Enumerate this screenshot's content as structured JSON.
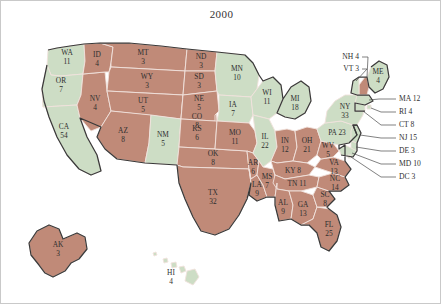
{
  "title": "2000",
  "colors": {
    "republican": "#c08a78",
    "democrat": "#cdddc5",
    "state_border": "#f0e2dc",
    "country_outline": "#3a3a3a",
    "background": "#ffffff",
    "frame": "#c9c9c9",
    "text": "#2f2f2f"
  },
  "chart_data": {
    "type": "map",
    "title": "2000",
    "subtitle": "",
    "xlabel": "",
    "ylabel": "",
    "legend": [],
    "value_field": "electoral_votes",
    "category_field": "party_color",
    "categories": [
      "republican",
      "democrat"
    ],
    "annotations": [],
    "states": [
      {
        "code": "WA",
        "votes": 11,
        "party": "democrat",
        "label": "WA",
        "value_label": "11"
      },
      {
        "code": "OR",
        "votes": 7,
        "party": "democrat",
        "label": "OR",
        "value_label": "7"
      },
      {
        "code": "CA",
        "votes": 54,
        "party": "democrat",
        "label": "CA",
        "value_label": "54"
      },
      {
        "code": "NV",
        "votes": 4,
        "party": "republican",
        "label": "NV",
        "value_label": "4"
      },
      {
        "code": "ID",
        "votes": 4,
        "party": "republican",
        "label": "ID",
        "value_label": "4"
      },
      {
        "code": "MT",
        "votes": 3,
        "party": "republican",
        "label": "MT",
        "value_label": "3"
      },
      {
        "code": "WY",
        "votes": 3,
        "party": "republican",
        "label": "WY",
        "value_label": "3"
      },
      {
        "code": "UT",
        "votes": 5,
        "party": "republican",
        "label": "UT",
        "value_label": "5"
      },
      {
        "code": "AZ",
        "votes": 8,
        "party": "republican",
        "label": "AZ",
        "value_label": "8"
      },
      {
        "code": "NM",
        "votes": 5,
        "party": "democrat",
        "label": "NM",
        "value_label": "5"
      },
      {
        "code": "CO",
        "votes": 8,
        "party": "republican",
        "label": "CO",
        "value_label": "8"
      },
      {
        "code": "ND",
        "votes": 3,
        "party": "republican",
        "label": "ND",
        "value_label": "3"
      },
      {
        "code": "SD",
        "votes": 3,
        "party": "republican",
        "label": "SD",
        "value_label": "3"
      },
      {
        "code": "NE",
        "votes": 5,
        "party": "republican",
        "label": "NE",
        "value_label": "5"
      },
      {
        "code": "KS",
        "votes": 6,
        "party": "republican",
        "label": "KS",
        "value_label": "6"
      },
      {
        "code": "OK",
        "votes": 8,
        "party": "republican",
        "label": "OK",
        "value_label": "8"
      },
      {
        "code": "TX",
        "votes": 32,
        "party": "republican",
        "label": "TX",
        "value_label": "32"
      },
      {
        "code": "MN",
        "votes": 10,
        "party": "democrat",
        "label": "MN",
        "value_label": "10"
      },
      {
        "code": "IA",
        "votes": 7,
        "party": "democrat",
        "label": "IA",
        "value_label": "7"
      },
      {
        "code": "MO",
        "votes": 11,
        "party": "republican",
        "label": "MO",
        "value_label": "11"
      },
      {
        "code": "AR",
        "votes": 6,
        "party": "republican",
        "label": "AR",
        "value_label": "6"
      },
      {
        "code": "LA",
        "votes": 9,
        "party": "republican",
        "label": "LA",
        "value_label": "9"
      },
      {
        "code": "WI",
        "votes": 11,
        "party": "democrat",
        "label": "WI",
        "value_label": "11"
      },
      {
        "code": "IL",
        "votes": 22,
        "party": "democrat",
        "label": "IL",
        "value_label": "22"
      },
      {
        "code": "MS",
        "votes": 7,
        "party": "republican",
        "label": "MS",
        "value_label": "7"
      },
      {
        "code": "MI",
        "votes": 18,
        "party": "democrat",
        "label": "MI",
        "value_label": "18"
      },
      {
        "code": "IN",
        "votes": 12,
        "party": "republican",
        "label": "IN",
        "value_label": "12"
      },
      {
        "code": "OH",
        "votes": 21,
        "party": "republican",
        "label": "OH",
        "value_label": "21"
      },
      {
        "code": "KY",
        "votes": 8,
        "party": "republican",
        "label": "KY 8",
        "value_label": ""
      },
      {
        "code": "TN",
        "votes": 11,
        "party": "republican",
        "label": "TN 11",
        "value_label": ""
      },
      {
        "code": "AL",
        "votes": 9,
        "party": "republican",
        "label": "AL",
        "value_label": "9"
      },
      {
        "code": "GA",
        "votes": 13,
        "party": "republican",
        "label": "GA",
        "value_label": "13"
      },
      {
        "code": "FL",
        "votes": 25,
        "party": "republican",
        "label": "FL",
        "value_label": "25"
      },
      {
        "code": "SC",
        "votes": 8,
        "party": "republican",
        "label": "SC",
        "value_label": "8"
      },
      {
        "code": "NC",
        "votes": 14,
        "party": "republican",
        "label": "NC",
        "value_label": "14"
      },
      {
        "code": "VA",
        "votes": 13,
        "party": "republican",
        "label": "VA",
        "value_label": "13"
      },
      {
        "code": "WV",
        "votes": 5,
        "party": "republican",
        "label": "WV",
        "value_label": "5"
      },
      {
        "code": "PA",
        "votes": 23,
        "party": "democrat",
        "label": "PA 23",
        "value_label": ""
      },
      {
        "code": "NY",
        "votes": 33,
        "party": "democrat",
        "label": "NY",
        "value_label": "33"
      },
      {
        "code": "ME",
        "votes": 4,
        "party": "democrat",
        "label": "ME",
        "value_label": "4"
      },
      {
        "code": "AK",
        "votes": 3,
        "party": "republican",
        "label": "AK",
        "value_label": "3"
      },
      {
        "code": "HI",
        "votes": 4,
        "party": "democrat",
        "label": "HI",
        "value_label": "4"
      }
    ],
    "callouts_left": [
      {
        "code": "NH",
        "votes": 4,
        "party": "republican",
        "text": "NH 4"
      },
      {
        "code": "VT",
        "votes": 3,
        "party": "democrat",
        "text": "VT 3"
      }
    ],
    "callouts_right": [
      {
        "code": "MA",
        "votes": 12,
        "party": "democrat",
        "text": "MA 12"
      },
      {
        "code": "RI",
        "votes": 4,
        "party": "democrat",
        "text": "RI 4"
      },
      {
        "code": "CT",
        "votes": 8,
        "party": "democrat",
        "text": "CT 8"
      },
      {
        "code": "NJ",
        "votes": 15,
        "party": "democrat",
        "text": "NJ 15"
      },
      {
        "code": "DE",
        "votes": 3,
        "party": "democrat",
        "text": "DE 3"
      },
      {
        "code": "MD",
        "votes": 10,
        "party": "democrat",
        "text": "MD 10"
      },
      {
        "code": "DC",
        "votes": 3,
        "party": "democrat",
        "text": "DC 3"
      }
    ]
  }
}
